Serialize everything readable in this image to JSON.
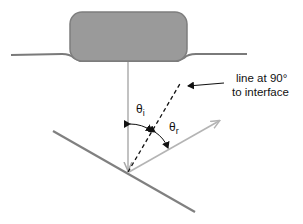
{
  "diagram": {
    "labels": {
      "normal_line_1": "line at 90°",
      "normal_line_2": "to interface",
      "theta_i": "θ",
      "theta_i_sub": "i",
      "theta_r": "θ",
      "theta_r_sub": "r"
    },
    "colors": {
      "object_fill": "#9a9a9a",
      "object_stroke": "#7e7e7e",
      "surface_line": "#7a7a7a",
      "incident_ray": "#a8a8a8",
      "reflected_ray": "#b4b4b4",
      "normal_line": "#111111",
      "interface_line": "#808080"
    }
  }
}
